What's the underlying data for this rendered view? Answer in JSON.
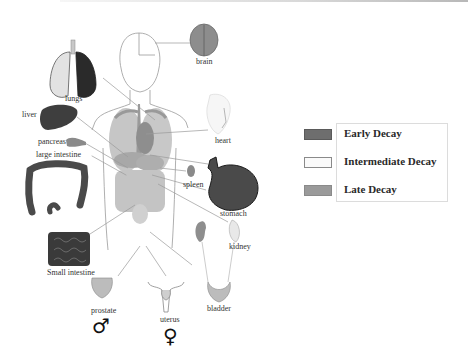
{
  "diagram": {
    "title": "",
    "organs": [
      {
        "id": "brain",
        "label": "brain"
      },
      {
        "id": "lungs",
        "label": "lungs"
      },
      {
        "id": "liver",
        "label": "liver"
      },
      {
        "id": "pancreas",
        "label": "pancreas"
      },
      {
        "id": "large-intestine",
        "label": "large intestine"
      },
      {
        "id": "heart",
        "label": "heart"
      },
      {
        "id": "spleen",
        "label": "spleen"
      },
      {
        "id": "stomach",
        "label": "stomach"
      },
      {
        "id": "kidney",
        "label": "kidney"
      },
      {
        "id": "small-intestine",
        "label": "Small intestine"
      },
      {
        "id": "prostate",
        "label": "prostate"
      },
      {
        "id": "uterus",
        "label": "uterus"
      },
      {
        "id": "bladder",
        "label": "bladder"
      }
    ],
    "symbols": {
      "male": "♂",
      "female": "♀"
    }
  },
  "legend": {
    "items": [
      {
        "label": "Early Decay",
        "color": "#6e6e6e",
        "border": "#5a5a5a"
      },
      {
        "label": "Intermediate Decay",
        "color": "#fafafa",
        "border": "#8a8a8a"
      },
      {
        "label": "Late Decay",
        "color": "#9a9a9a",
        "border": "#8a8a8a"
      }
    ]
  }
}
